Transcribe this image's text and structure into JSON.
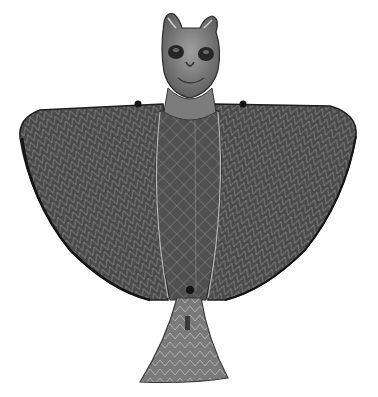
{
  "image": {
    "subject": "Bronze bird-shaped artifact with feline head",
    "alt": "Grayscale photograph of a cast metal figure with an animal (feline/owl-like) head with pointed ears and large eye sockets, broad triangular wings with incised herringbone and crosshatch patterns, and a flared trapezoidal tail with chevron engraving",
    "background": "#ffffff",
    "colors": {
      "dark_metal": "#3a3a3a",
      "mid_metal": "#6b6b6b",
      "light_metal": "#a8a8a8",
      "highlight": "#d0d0d0",
      "shadow": "#1e1e1e"
    }
  }
}
